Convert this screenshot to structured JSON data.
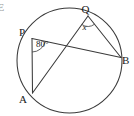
{
  "figure": {
    "name": "circle-inscribed-angles-diagram",
    "width": 134,
    "height": 116,
    "background_color": "#ffffff",
    "stroke_color": "#3a3a3a",
    "text_color": "#1a1a1a"
  },
  "circle": {
    "name": "main-circle",
    "center_x": 69.5,
    "center_y": 60.5,
    "radius": 52.5
  },
  "points": [
    {
      "label": "P",
      "x": 32.0,
      "y": 38.5,
      "label_x": 19.0,
      "label_y": 36.0
    },
    {
      "label": "Q",
      "x": 88.0,
      "y": 16.0,
      "label_x": 81.5,
      "label_y": 13.0
    },
    {
      "label": "A",
      "x": 32.5,
      "y": 93.0,
      "label_x": 19.0,
      "label_y": 103.0
    },
    {
      "label": "B",
      "x": 121.0,
      "y": 57.5,
      "label_x": 122.0,
      "label_y": 64.0
    }
  ],
  "chords": [
    {
      "name": "chord-P-A",
      "from": "P",
      "to": "A"
    },
    {
      "name": "chord-P-B",
      "from": "P",
      "to": "B"
    },
    {
      "name": "chord-A-Q",
      "from": "A",
      "to": "Q"
    },
    {
      "name": "chord-Q-B",
      "from": "Q",
      "to": "B"
    }
  ],
  "angles": [
    {
      "name": "angle-at-P",
      "vertex": "P",
      "value": "80",
      "degree_symbol": "°",
      "label_x": 36.0,
      "label_y": 47.0,
      "arc_radius": 13.5
    },
    {
      "name": "angle-at-Q",
      "vertex": "Q",
      "value": "x",
      "label_x": 84.5,
      "label_y": 30.0,
      "arc_radius": 10.5
    }
  ],
  "edge_artifact": {
    "name": "cropped-edge-glyph",
    "text": "E",
    "x": -2.5,
    "y": 11.0
  }
}
